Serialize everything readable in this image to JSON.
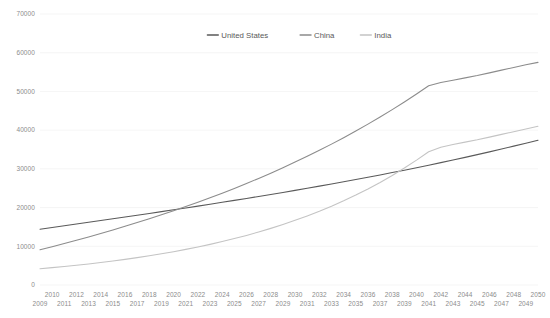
{
  "chart_data": {
    "type": "line",
    "title": "",
    "subtitle": "",
    "xlabel": "",
    "ylabel": "",
    "xlim": [
      2009,
      2050
    ],
    "ylim": [
      0,
      70000
    ],
    "grid": true,
    "legend_position": "top-center",
    "y_ticks": [
      0,
      10000,
      20000,
      30000,
      40000,
      50000,
      60000,
      70000
    ],
    "y_tick_labels": [
      "0",
      "10000",
      "20000",
      "30000",
      "40000",
      "50000",
      "60000",
      "70000"
    ],
    "x_tick_labels_top": [
      "2010",
      "2012",
      "2014",
      "2016",
      "2018",
      "2020",
      "2022",
      "2024",
      "2026",
      "2028",
      "2030",
      "2032",
      "2034",
      "2036",
      "2038",
      "2040",
      "2042",
      "2044",
      "2046",
      "2048",
      "2050"
    ],
    "x_tick_labels_bottom": [
      "2009",
      "2011",
      "2013",
      "2015",
      "2017",
      "2019",
      "2021",
      "2023",
      "2025",
      "2027",
      "2029",
      "2031",
      "2033",
      "2035",
      "2037",
      "2039",
      "2041",
      "2043",
      "2045",
      "2047",
      "2049"
    ],
    "x": [
      2009,
      2010,
      2011,
      2012,
      2013,
      2014,
      2015,
      2016,
      2017,
      2018,
      2019,
      2020,
      2021,
      2022,
      2023,
      2024,
      2025,
      2026,
      2027,
      2028,
      2029,
      2030,
      2031,
      2032,
      2033,
      2034,
      2035,
      2036,
      2037,
      2038,
      2039,
      2040,
      2041,
      2042,
      2043,
      2044,
      2045,
      2046,
      2047,
      2048,
      2049,
      2050
    ],
    "series": [
      {
        "name": "United States",
        "color": "#5a5a5a",
        "values": [
          14400,
          14850,
          15300,
          15750,
          16200,
          16650,
          17100,
          17560,
          18020,
          18480,
          18950,
          19420,
          19900,
          20380,
          20870,
          21360,
          21860,
          22360,
          22870,
          23390,
          23910,
          24440,
          24980,
          25530,
          26090,
          26660,
          27240,
          27830,
          28430,
          29040,
          29660,
          30300,
          30950,
          31610,
          32280,
          32970,
          33670,
          34390,
          35120,
          35870,
          36630,
          37400
        ]
      },
      {
        "name": "China",
        "color": "#8c8c8c",
        "values": [
          9100,
          9900,
          10720,
          11560,
          12420,
          13310,
          14220,
          15160,
          16120,
          17110,
          18130,
          19180,
          20260,
          21380,
          22530,
          23720,
          24950,
          26220,
          27530,
          28890,
          30290,
          31740,
          33240,
          34790,
          36390,
          38050,
          39770,
          41550,
          43390,
          45300,
          47280,
          49330,
          51450,
          52300,
          52900,
          53500,
          54100,
          54800,
          55500,
          56200,
          56900,
          57500
        ]
      },
      {
        "name": "India",
        "color": "#c4c4c4",
        "values": [
          4200,
          4480,
          4780,
          5100,
          5440,
          5810,
          6200,
          6620,
          7070,
          7550,
          8060,
          8610,
          9200,
          9830,
          10500,
          11220,
          11990,
          12810,
          13690,
          14630,
          15630,
          16700,
          17840,
          19060,
          20360,
          21750,
          23230,
          24810,
          26500,
          28300,
          30220,
          32260,
          34430,
          35600,
          36300,
          36900,
          37500,
          38200,
          38900,
          39600,
          40300,
          41000
        ]
      }
    ],
    "annotations": {
      "us_china_crossover_year": 2018,
      "us_china_crossover_value": 18300,
      "us_india_crossover_year": 2047,
      "us_india_crossover_value": 35100
    }
  },
  "legend": {
    "items": [
      {
        "label": "United States"
      },
      {
        "label": "China"
      },
      {
        "label": "India"
      }
    ]
  },
  "colors": {
    "background": "#ffffff",
    "gridline": "#f2f2f2",
    "tick_text": "#8c8c8c",
    "legend_text": "#595959"
  }
}
